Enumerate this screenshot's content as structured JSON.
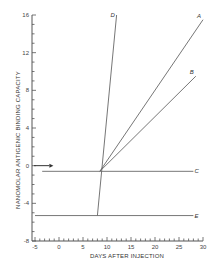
{
  "chart_data": {
    "type": "line",
    "title": "",
    "xlabel": "DAYS AFTER INJECTION",
    "ylabel": "NANOMOLAR ANTIGENIC BINDING CAPACITY",
    "xlim": [
      -5,
      30
    ],
    "ylim": [
      -8,
      16
    ],
    "x_ticks": [
      "-5",
      "0",
      "5",
      "10",
      "15",
      "20",
      "25",
      "30"
    ],
    "y_ticks": [
      "16",
      "12",
      "8",
      "4",
      "0",
      "-4",
      "-8"
    ],
    "grid": false,
    "legend": "inline curve labels",
    "series": [
      {
        "name": "A",
        "x": [
          8.5,
          30
        ],
        "y": [
          -0.6,
          15.5
        ]
      },
      {
        "name": "B",
        "x": [
          8.5,
          28.5
        ],
        "y": [
          -0.6,
          9.5
        ]
      },
      {
        "name": "C",
        "x": [
          -3.5,
          28
        ],
        "y": [
          -0.6,
          -0.6
        ]
      },
      {
        "name": "D",
        "x": [
          8,
          12
        ],
        "y": [
          -5.3,
          16
        ]
      },
      {
        "name": "E",
        "x": [
          -5,
          28
        ],
        "y": [
          -5.3,
          -5.3
        ]
      }
    ],
    "annotations": [
      {
        "type": "arrow",
        "at_y": 0,
        "pointing": "right",
        "x_from": -5,
        "x_to": -2
      }
    ]
  },
  "labels": {
    "A": "A",
    "B": "B",
    "C": "C",
    "D": "D",
    "E": "E"
  }
}
